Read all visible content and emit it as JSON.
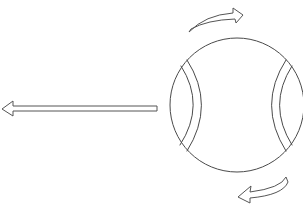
{
  "diagram": {
    "title": "",
    "elements": [
      {
        "name": "tennis-ball",
        "description": "ball drawn as a circle with two curved seams"
      },
      {
        "name": "motion-arrow",
        "direction": "left",
        "description": "long straight arrow indicating ball travel direction"
      },
      {
        "name": "spin-arrow-top",
        "direction": "clockwise",
        "description": "curved arrow above ball pointing right"
      },
      {
        "name": "spin-arrow-bottom",
        "direction": "clockwise",
        "description": "curved arrow below ball pointing left"
      }
    ],
    "colors": {
      "line": "#4a4a4a",
      "background": "#ffffff"
    }
  }
}
